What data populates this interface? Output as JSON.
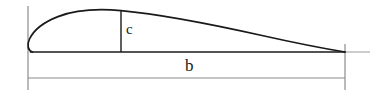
{
  "figure": {
    "name": "wing-planform-diagram",
    "type": "line-drawing",
    "background_color": "#ffffff",
    "outline_color": "#1a1a1a",
    "extension_line_color": "#8c8c8c",
    "dimension_line_color": "#8c8c8c"
  },
  "labels": {
    "chord": "c",
    "span": "b"
  },
  "annotations": {
    "chord_description": "chord dimension, vertical line from wing upper surface down to root baseline",
    "span_description": "span dimension, horizontal dimension line below the planform"
  },
  "geometry": {
    "baseline_y": 52,
    "root_x": 28,
    "tip_x": 345,
    "peak_x": 121,
    "peak_y": 11,
    "chord_line_x": 121,
    "dimension_line_y": 78,
    "extension_top_y": 6,
    "extension_bottom_y": 90,
    "baseline_overrun_x": 370
  }
}
